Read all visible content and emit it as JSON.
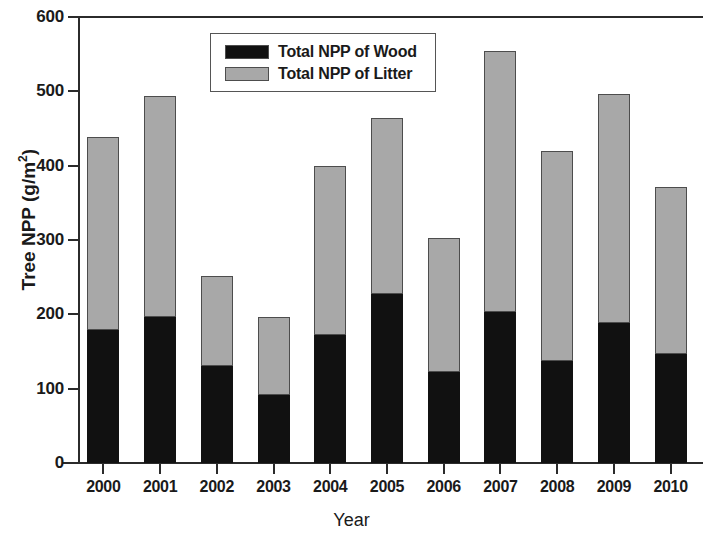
{
  "chart_data": {
    "type": "bar",
    "subtype": "stacked-bar",
    "title": "",
    "xlabel": "Year",
    "ylabel": "Tree NPP (g/m2)",
    "ylabel_display": "Tree NPP (g/m",
    "ylabel_sup": "2",
    "ylabel_tail": ")",
    "categories": [
      "2000",
      "2001",
      "2002",
      "2003",
      "2004",
      "2005",
      "2006",
      "2007",
      "2008",
      "2009",
      "2010"
    ],
    "series": [
      {
        "name": "Total NPP of Wood",
        "color": "#111111",
        "values": [
          179,
          196,
          131,
          91,
          172,
          227,
          122,
          203,
          137,
          188,
          146
        ]
      },
      {
        "name": "Total NPP of Litter",
        "color": "#a8a8a8",
        "values": [
          259,
          298,
          121,
          106,
          228,
          237,
          181,
          351,
          283,
          309,
          225
        ]
      }
    ],
    "totals": [
      438,
      494,
      252,
      197,
      400,
      464,
      303,
      554,
      420,
      497,
      371
    ],
    "ylim": [
      0,
      600
    ],
    "ytick_values": [
      0,
      100,
      200,
      300,
      400,
      500,
      600
    ],
    "ytick_labels": [
      "0",
      "100",
      "200",
      "300",
      "400",
      "500",
      "600"
    ],
    "grid": false,
    "legend_position": "top-center",
    "legend_entries": [
      "Total NPP of Wood",
      "Total NPP of Litter"
    ]
  },
  "legend": {
    "items": [
      {
        "label": "Total NPP of Wood",
        "swatch": "black-swatch"
      },
      {
        "label": "Total NPP of Litter",
        "swatch": "gray-swatch"
      }
    ]
  },
  "axes": {
    "y_title_main": "Tree NPP (g/m",
    "y_title_sup": "2",
    "y_title_end": ")",
    "x_title": "Year"
  }
}
